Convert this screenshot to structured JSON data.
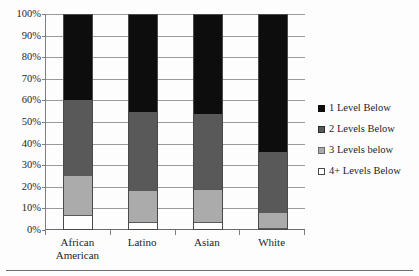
{
  "page": {
    "top_cut_text": "",
    "footer_rule": true
  },
  "chart_data": {
    "type": "bar",
    "subtype": "stacked-100-percent",
    "title": "",
    "xlabel": "",
    "ylabel": "",
    "ylim": [
      0,
      100
    ],
    "ytick_labels": [
      "0%",
      "10%",
      "20%",
      "30%",
      "40%",
      "50%",
      "60%",
      "70%",
      "80%",
      "90%",
      "100%"
    ],
    "ytick_values": [
      0,
      10,
      20,
      30,
      40,
      50,
      60,
      70,
      80,
      90,
      100
    ],
    "grid": true,
    "legend_position": "right",
    "categories": [
      "African American",
      "Latino",
      "Asian",
      "White"
    ],
    "category_label_lines": [
      [
        "African",
        "American"
      ],
      [
        "Latino"
      ],
      [
        "Asian"
      ],
      [
        "White"
      ]
    ],
    "series": [
      {
        "name": "1 Level Below",
        "color": "#0d0d0d",
        "values": [
          40,
          45.5,
          46.5,
          64
        ]
      },
      {
        "name": "2 Levels Below",
        "color": "#595959",
        "values": [
          35,
          36.5,
          35,
          28
        ]
      },
      {
        "name": "3 Levels below",
        "color": "#ababab",
        "values": [
          18,
          14.5,
          15,
          7
        ]
      },
      {
        "name": "4+ Levels Below",
        "color": "#ffffff",
        "values": [
          7,
          3.5,
          3.5,
          1
        ]
      }
    ],
    "stack_order_bottom_to_top": [
      "4+ Levels Below",
      "3 Levels below",
      "2 Levels Below",
      "1 Level Below"
    ],
    "cumulative_tops": {
      "African American": {
        "4+ Levels Below": 7,
        "3 Levels below": 25,
        "2 Levels Below": 60,
        "1 Level Below": 100
      },
      "Latino": {
        "4+ Levels Below": 3.5,
        "3 Levels below": 18,
        "2 Levels Below": 54.5,
        "1 Level Below": 100
      },
      "Asian": {
        "4+ Levels Below": 3.5,
        "3 Levels below": 18.5,
        "2 Levels Below": 53.5,
        "1 Level Below": 100
      },
      "White": {
        "4+ Levels Below": 1,
        "3 Levels below": 8,
        "2 Levels Below": 36,
        "1 Level Below": 100
      }
    }
  }
}
